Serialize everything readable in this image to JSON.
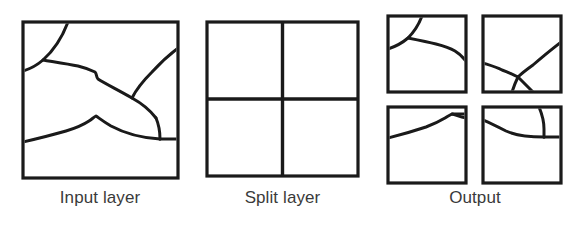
{
  "figure": {
    "type": "diagram",
    "title": "",
    "background_color": "#ffffff",
    "line_color": "#1a1a1a",
    "label_color": "#3a3a3a"
  },
  "panels": [
    {
      "id": "input",
      "label": "Input layer",
      "square": {
        "x": 23,
        "y": 22,
        "width": 155,
        "height": 156
      },
      "content": "irregular region boundaries"
    },
    {
      "id": "split",
      "label": "Split layer",
      "square": {
        "x": 207,
        "y": 22,
        "width": 151,
        "height": 154
      },
      "content": "2x2 grid of four equal cells",
      "rows": 2,
      "columns": 2
    },
    {
      "id": "output",
      "label": "Output",
      "content": "four separate tiles, each holding the clipped region boundaries",
      "tiles": [
        {
          "id": "output-tile-top-left",
          "x": 388,
          "y": 16,
          "width": 78,
          "height": 76
        },
        {
          "id": "output-tile-top-right",
          "x": 483,
          "y": 16,
          "width": 78,
          "height": 76
        },
        {
          "id": "output-tile-bottom-left",
          "x": 388,
          "y": 107,
          "width": 78,
          "height": 76
        },
        {
          "id": "output-tile-bottom-right",
          "x": 483,
          "y": 107,
          "width": 78,
          "height": 76
        }
      ]
    }
  ],
  "labels": {
    "input": "Input layer",
    "split": "Split layer",
    "output": "Output"
  }
}
